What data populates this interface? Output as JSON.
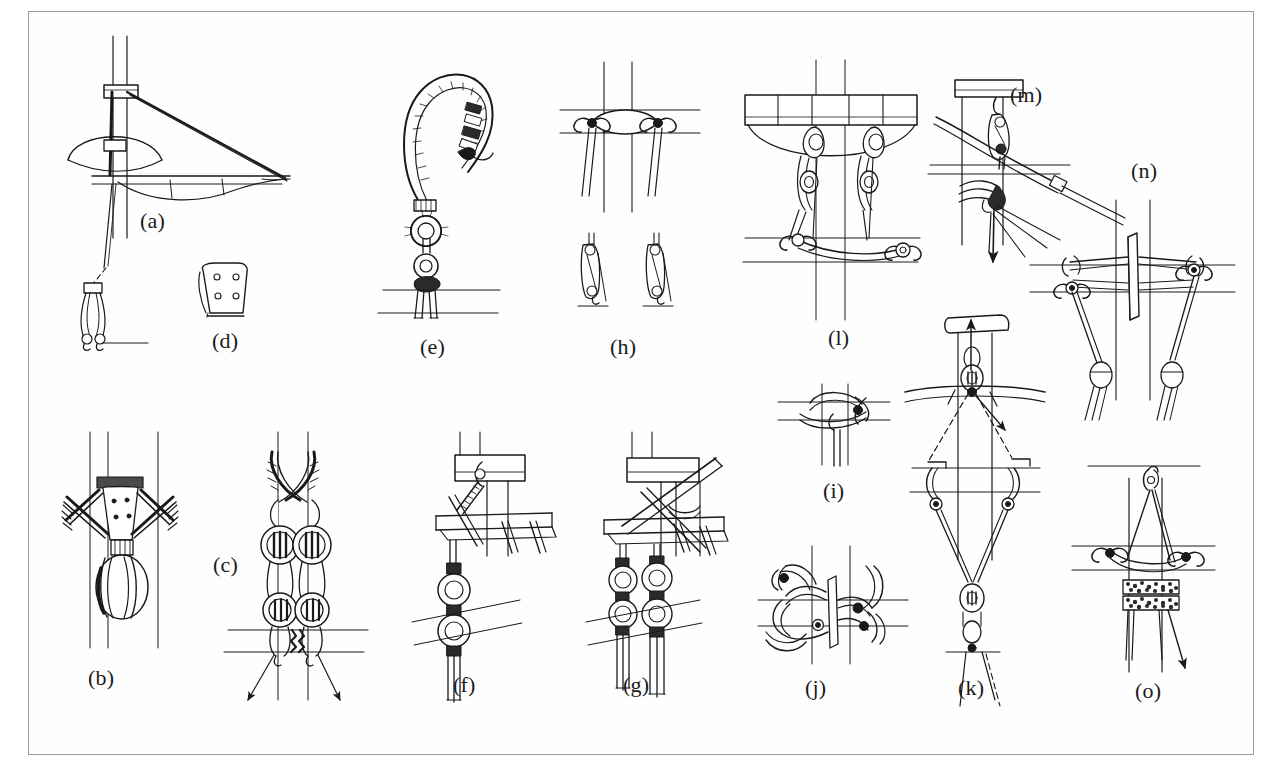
{
  "plate": {
    "title": "Rigging hardware and fitting details",
    "description": "Technical pen-and-ink line drawing plate showing fifteen sailing-rig detail studies labelled (a) through (o): masthead and bowsprit assembly, lashed blocks, shroud crossings, chainplate tang, rope grommet and thimbles, deck-level tackle arrangements, crosstrees and spreader lashings, and halyard purchase systems.",
    "medium": "pen-and-ink line drawing",
    "frame_color": "#9b9b9b",
    "ink_color": "#1a1a1a",
    "background_color": "#ffffff"
  },
  "figures": [
    {
      "id": "a",
      "label": "(a)",
      "x": 140,
      "y": 212,
      "caption": "Masthead with bowsprit, diagonal stay and hanging block"
    },
    {
      "id": "b",
      "label": "(b)",
      "x": 88,
      "y": 676,
      "caption": "Shroud ends seized to a tang with round thimble"
    },
    {
      "id": "c",
      "label": "(c)",
      "x": 215,
      "y": 562,
      "caption": "Pair of crossed shrouds through deadeyes with lanyards"
    },
    {
      "id": "d",
      "label": "(d)",
      "x": 212,
      "y": 334,
      "caption": "Chainplate tang plate with four fastening holes"
    },
    {
      "id": "e",
      "label": "(e)",
      "x": 428,
      "y": 341,
      "caption": "Rope grommet loop with served eye and two thimbles"
    },
    {
      "id": "f",
      "label": "(f)",
      "x": 634,
      "y": 681,
      "caption": "Masthead cap with single tackle and thimbles"
    },
    {
      "id": "g",
      "label": "(g)",
      "x": 623,
      "y": 681,
      "caption": "Masthead cap with double tackle and crossed spars"
    },
    {
      "id": "h",
      "label": "(h)",
      "x": 617,
      "y": 341,
      "caption": "Crosstree lashing with two blocks below"
    },
    {
      "id": "i",
      "label": "(i)",
      "x": 828,
      "y": 426,
      "caption": "Crossed line seizing over a spar"
    },
    {
      "id": "j",
      "label": "(j)",
      "x": 808,
      "y": 686,
      "caption": "Spreader end with lashed shroud crossings"
    },
    {
      "id": "k",
      "label": "(k)",
      "x": 962,
      "y": 686,
      "caption": "Masthead halyard purchase with dashed lead lines and arrows"
    },
    {
      "id": "l",
      "label": "(l)",
      "x": 831,
      "y": 334,
      "caption": "Crosstree assembly with twin blocks and deck lashings"
    },
    {
      "id": "m",
      "label": "(m)",
      "x": 1016,
      "y": 95,
      "caption": "Mast cap with block, spar lashing and downward arrow"
    },
    {
      "id": "n",
      "label": "(n)",
      "x": 1136,
      "y": 170,
      "caption": "Symmetrical spreader pair with blocks and stays"
    },
    {
      "id": "o",
      "label": "(o)",
      "x": 1140,
      "y": 688,
      "caption": "Mast with parrel beads, strop and downward arrow"
    }
  ]
}
